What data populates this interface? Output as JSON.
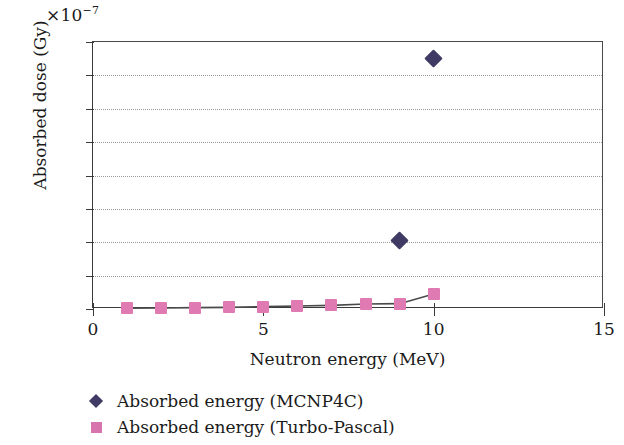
{
  "chart_data": {
    "type": "scatter",
    "title": "",
    "xlabel": "Neutron energy (MeV)",
    "ylabel": "Absorbed dose (Gy)",
    "y_multiplier": "×10",
    "y_multiplier_exponent": "−7",
    "xlim": [
      0,
      15
    ],
    "ylim": [
      0,
      1.6
    ],
    "xticks": [
      "0",
      "5",
      "10",
      "15"
    ],
    "xtick_values": [
      0,
      5,
      10,
      15
    ],
    "yticks": [
      "0",
      "0.2",
      "0.4",
      "0.6",
      "0.8",
      "1",
      "1.2",
      "1.4",
      "1.6"
    ],
    "ytick_values": [
      0,
      0.2,
      0.4,
      0.6,
      0.8,
      1,
      1.2,
      1.4,
      1.6
    ],
    "grid": "horizontal-dotted",
    "legend_position": "below-left",
    "series": [
      {
        "name": "Absorbed energy (MCNP4C)",
        "marker": "diamond",
        "color": "#3f3b64",
        "x": [
          9,
          10
        ],
        "values": [
          0.41,
          1.5
        ]
      },
      {
        "name": "Absorbed energy (Turbo-Pascal)",
        "marker": "square",
        "color": "#e07ab3",
        "x": [
          1,
          2,
          3,
          4,
          5,
          6,
          7,
          8,
          9,
          10
        ],
        "values": [
          0.005,
          0.006,
          0.008,
          0.01,
          0.014,
          0.018,
          0.022,
          0.03,
          0.032,
          0.09
        ]
      }
    ]
  },
  "legend": {
    "items": [
      {
        "label": "Absorbed energy (MCNP4C)",
        "marker": "diamond"
      },
      {
        "label": "Absorbed energy (Turbo-Pascal)",
        "marker": "square"
      }
    ]
  }
}
